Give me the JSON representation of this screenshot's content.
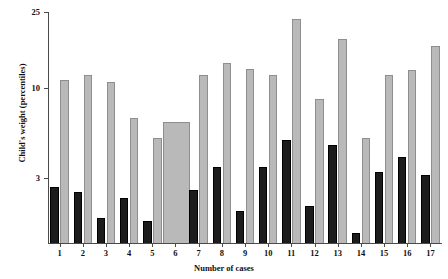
{
  "chart_data": {
    "type": "bar",
    "title": "",
    "subtitle": "",
    "xlabel": "Number of cases",
    "ylabel": "Child's weight (percentiles)",
    "yscale": "log",
    "ylim": [
      0.95,
      25
    ],
    "ytick_labels": [
      "25",
      "10",
      "3"
    ],
    "ytick_values": [
      25,
      10,
      3
    ],
    "grid": false,
    "legend": "none",
    "categories": [
      "1",
      "2",
      "3",
      "4",
      "5",
      "6",
      "7",
      "8",
      "9",
      "10",
      "11",
      "12",
      "13",
      "14",
      "15",
      "16",
      "17"
    ],
    "series": [
      {
        "name": "dark-bar",
        "color": "#1c1c1c",
        "values": [
          2.1,
          1.95,
          1.35,
          1.8,
          1.3,
          null,
          2.0,
          2.8,
          1.5,
          2.8,
          4.1,
          1.6,
          3.8,
          1.1,
          2.6,
          3.2,
          2.5
        ]
      },
      {
        "name": "light-bar",
        "color": "#b9b9b9",
        "values": [
          9.5,
          10.2,
          9.3,
          5.6,
          4.2,
          5.3,
          10.3,
          12.2,
          11.2,
          10.3,
          22.5,
          7.3,
          17.0,
          4.2,
          10.3,
          11.0,
          15.5
        ]
      }
    ]
  },
  "axes": {
    "y_ticks": [
      {
        "label": "25",
        "y": 12
      },
      {
        "label": "10",
        "y": 88
      },
      {
        "label": "3",
        "y": 178
      }
    ],
    "x_ticks": [
      "1",
      "2",
      "3",
      "4",
      "5",
      "6",
      "7",
      "8",
      "9",
      "10",
      "11",
      "12",
      "13",
      "14",
      "15",
      "16",
      "17"
    ]
  },
  "colors": {
    "light_bar": "#b9b9b9",
    "light_bar_edge": "#8e8e8e",
    "dark_bar": "#1c1c1c",
    "axis": "#4a4a4a",
    "text": "#111111",
    "background": "#ffffff"
  }
}
